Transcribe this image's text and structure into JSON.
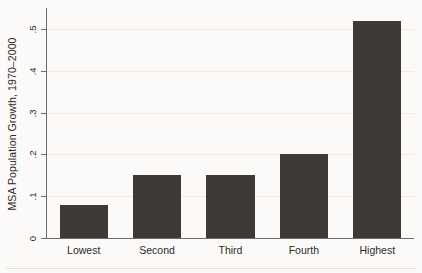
{
  "chart_data": {
    "type": "bar",
    "title": "",
    "subtitle": "",
    "xlabel": "",
    "ylabel": "MSA Population Growth, 1970–2000",
    "categories": [
      "Lowest",
      "Second",
      "Third",
      "Fourth",
      "Highest"
    ],
    "values": [
      0.08,
      0.15,
      0.15,
      0.2,
      0.52
    ],
    "ylim": [
      0,
      0.55
    ],
    "yticks": [
      0,
      0.1,
      0.2,
      0.3,
      0.4,
      0.5
    ],
    "ytick_labels": [
      "0",
      ".1",
      ".2",
      ".3",
      ".4",
      ".5"
    ],
    "grid": true,
    "legend": null,
    "bar_color": "#3d3a38",
    "background_color": "#fbfaf8",
    "axis_color": "#6e6c6a",
    "gridline_color": "#eeebe7"
  }
}
